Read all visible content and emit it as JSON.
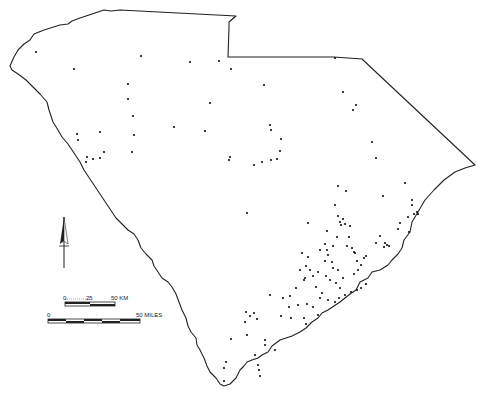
{
  "map": {
    "region": "South Carolina",
    "border_color": "#222222",
    "point_color": "#111111",
    "background": "#ffffff"
  },
  "north_arrow": {
    "icon": "north-arrow-icon"
  },
  "scale_km": {
    "ticks": [
      "0",
      "25",
      "50 KM"
    ]
  },
  "scale_miles": {
    "ticks": [
      "0",
      "50 MILES"
    ]
  },
  "points": [
    [
      36,
      52
    ],
    [
      74,
      69
    ],
    [
      141,
      56
    ],
    [
      190,
      62
    ],
    [
      219,
      61
    ],
    [
      231,
      69
    ],
    [
      264,
      85
    ],
    [
      335,
      58
    ],
    [
      128,
      84
    ],
    [
      128,
      99
    ],
    [
      133,
      116
    ],
    [
      210,
      103
    ],
    [
      343,
      92
    ],
    [
      356,
      105
    ],
    [
      353,
      110
    ],
    [
      77,
      134
    ],
    [
      78,
      140
    ],
    [
      100,
      132
    ],
    [
      174,
      127
    ],
    [
      205,
      131
    ],
    [
      270,
      125
    ],
    [
      271,
      130
    ],
    [
      281,
      139
    ],
    [
      280,
      151
    ],
    [
      277,
      159
    ],
    [
      271,
      160
    ],
    [
      262,
      162
    ],
    [
      254,
      165
    ],
    [
      230,
      157
    ],
    [
      229,
      160
    ],
    [
      134,
      135
    ],
    [
      132,
      152
    ],
    [
      87,
      157
    ],
    [
      93,
      159
    ],
    [
      86,
      162
    ],
    [
      100,
      158
    ],
    [
      104,
      152
    ],
    [
      372,
      142
    ],
    [
      376,
      158
    ],
    [
      338,
      186
    ],
    [
      346,
      191
    ],
    [
      383,
      196
    ],
    [
      405,
      183
    ],
    [
      412,
      200
    ],
    [
      417,
      212
    ],
    [
      247,
      213
    ],
    [
      335,
      205
    ],
    [
      338,
      216
    ],
    [
      340,
      222
    ],
    [
      343,
      219
    ],
    [
      341,
      225
    ],
    [
      345,
      224
    ],
    [
      350,
      226
    ],
    [
      308,
      223
    ],
    [
      408,
      217
    ],
    [
      409,
      232
    ],
    [
      398,
      229
    ],
    [
      400,
      223
    ],
    [
      418,
      214
    ],
    [
      414,
      214
    ],
    [
      412,
      205
    ],
    [
      380,
      236
    ],
    [
      376,
      243
    ],
    [
      385,
      243
    ],
    [
      389,
      246
    ],
    [
      384,
      247
    ],
    [
      387,
      245
    ],
    [
      327,
      231
    ],
    [
      325,
      244
    ],
    [
      327,
      250
    ],
    [
      333,
      246
    ],
    [
      328,
      255
    ],
    [
      332,
      262
    ],
    [
      337,
      237
    ],
    [
      349,
      237
    ],
    [
      347,
      246
    ],
    [
      352,
      248
    ],
    [
      355,
      253
    ],
    [
      354,
      252
    ],
    [
      302,
      253
    ],
    [
      308,
      257
    ],
    [
      306,
      266
    ],
    [
      300,
      270
    ],
    [
      305,
      278
    ],
    [
      304,
      280
    ],
    [
      320,
      250
    ],
    [
      325,
      261
    ],
    [
      333,
      268
    ],
    [
      338,
      270
    ],
    [
      336,
      283
    ],
    [
      343,
      278
    ],
    [
      354,
      274
    ],
    [
      358,
      270
    ],
    [
      361,
      265
    ],
    [
      357,
      261
    ],
    [
      364,
      258
    ],
    [
      366,
      256
    ],
    [
      310,
      270
    ],
    [
      313,
      276
    ],
    [
      318,
      272
    ],
    [
      326,
      276
    ],
    [
      330,
      280
    ],
    [
      340,
      288
    ],
    [
      345,
      295
    ],
    [
      351,
      292
    ],
    [
      357,
      290
    ],
    [
      361,
      288
    ],
    [
      366,
      284
    ],
    [
      316,
      287
    ],
    [
      322,
      293
    ],
    [
      320,
      298
    ],
    [
      328,
      300
    ],
    [
      335,
      302
    ],
    [
      339,
      298
    ],
    [
      296,
      288
    ],
    [
      290,
      296
    ],
    [
      298,
      305
    ],
    [
      307,
      304
    ],
    [
      313,
      307
    ],
    [
      318,
      315
    ],
    [
      270,
      295
    ],
    [
      283,
      298
    ],
    [
      289,
      307
    ],
    [
      281,
      316
    ],
    [
      291,
      318
    ],
    [
      304,
      318
    ],
    [
      306,
      324
    ],
    [
      246,
      312
    ],
    [
      250,
      316
    ],
    [
      254,
      313
    ],
    [
      257,
      319
    ],
    [
      245,
      322
    ],
    [
      231,
      339
    ],
    [
      247,
      335
    ],
    [
      265,
      340
    ],
    [
      265,
      345
    ],
    [
      275,
      350
    ],
    [
      255,
      355
    ],
    [
      258,
      365
    ],
    [
      259,
      370
    ],
    [
      260,
      376
    ],
    [
      226,
      362
    ],
    [
      224,
      368
    ],
    [
      224,
      381
    ]
  ]
}
